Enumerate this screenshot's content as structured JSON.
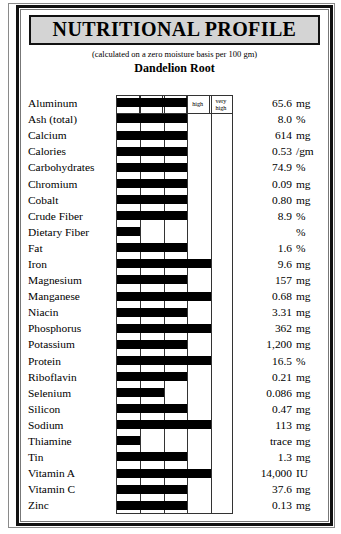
{
  "title": "NUTRITIONAL PROFILE",
  "subtitle": "(calculated on a zero moisture basis per 100 gm)",
  "plant": "Dandelion Root",
  "scale_headers": [
    "very low",
    "low",
    "ave",
    "high",
    "very high"
  ],
  "chart_data": {
    "type": "bar",
    "title": "NUTRITIONAL PROFILE",
    "subtitle": "(calculated on a zero moisture basis per 100 gm)",
    "xlabel": "",
    "ylabel": "",
    "orientation": "horizontal",
    "grid": true,
    "legend": "none",
    "scale_levels": [
      "very low",
      "low",
      "ave",
      "high",
      "very high"
    ],
    "xlim": [
      0,
      5
    ],
    "note": "bar_level is the bar's right-edge position on the 5-step scale (1 = end of 'very low', 3 = end of 'ave', 5 = end of 'very high')",
    "categories": [
      "Aluminum",
      "Ash (total)",
      "Calcium",
      "Calories",
      "Carbohydrates",
      "Chromium",
      "Cobalt",
      "Crude Fiber",
      "Dietary Fiber",
      "Fat",
      "Iron",
      "Magnesium",
      "Manganese",
      "Niacin",
      "Phosphorus",
      "Potassium",
      "Protein",
      "Riboflavin",
      "Selenium",
      "Silicon",
      "Sodium",
      "Thiamine",
      "Tin",
      "Vitamin A",
      "Vitamin C",
      "Zinc"
    ],
    "values": [
      65.6,
      8.0,
      614,
      0.53,
      74.9,
      0.09,
      0.8,
      8.9,
      null,
      1.6,
      9.6,
      157,
      0.68,
      3.31,
      362,
      1200,
      16.5,
      0.21,
      0.086,
      0.47,
      113,
      null,
      1.3,
      14000,
      37.6,
      0.13
    ],
    "bar_levels": [
      3,
      3,
      3,
      3,
      3,
      3,
      3,
      3,
      1,
      3,
      4,
      3,
      4,
      3,
      4,
      3,
      4,
      3,
      2,
      3,
      4,
      1,
      3,
      4,
      3,
      3
    ]
  },
  "rows": [
    {
      "name": "Aluminum",
      "value": "65.6",
      "unit": "mg",
      "level": 3
    },
    {
      "name": "Ash (total)",
      "value": "8.0",
      "unit": "%",
      "level": 3
    },
    {
      "name": "Calcium",
      "value": "614",
      "unit": "mg",
      "level": 3
    },
    {
      "name": "Calories",
      "value": "0.53",
      "unit": "/gm",
      "level": 3
    },
    {
      "name": "Carbohydrates",
      "value": "74.9",
      "unit": "%",
      "level": 3
    },
    {
      "name": "Chromium",
      "value": "0.09",
      "unit": "mg",
      "level": 3
    },
    {
      "name": "Cobalt",
      "value": "0.80",
      "unit": "mg",
      "level": 3
    },
    {
      "name": "Crude Fiber",
      "value": "8.9",
      "unit": "%",
      "level": 3
    },
    {
      "name": "Dietary Fiber",
      "value": "",
      "unit": "%",
      "level": 1
    },
    {
      "name": "Fat",
      "value": "1.6",
      "unit": "%",
      "level": 3
    },
    {
      "name": "Iron",
      "value": "9.6",
      "unit": "mg",
      "level": 4
    },
    {
      "name": "Magnesium",
      "value": "157",
      "unit": "mg",
      "level": 3
    },
    {
      "name": "Manganese",
      "value": "0.68",
      "unit": "mg",
      "level": 4
    },
    {
      "name": "Niacin",
      "value": "3.31",
      "unit": "mg",
      "level": 3
    },
    {
      "name": "Phosphorus",
      "value": "362",
      "unit": "mg",
      "level": 4
    },
    {
      "name": "Potassium",
      "value": "1,200",
      "unit": "mg",
      "level": 3
    },
    {
      "name": "Protein",
      "value": "16.5",
      "unit": "%",
      "level": 4
    },
    {
      "name": "Riboflavin",
      "value": "0.21",
      "unit": "mg",
      "level": 3
    },
    {
      "name": "Selenium",
      "value": "0.086",
      "unit": "mg",
      "level": 2
    },
    {
      "name": "Silicon",
      "value": "0.47",
      "unit": "mg",
      "level": 3
    },
    {
      "name": "Sodium",
      "value": "113",
      "unit": "mg",
      "level": 4
    },
    {
      "name": "Thiamine",
      "value": "trace",
      "unit": "mg",
      "level": 1
    },
    {
      "name": "Tin",
      "value": "1.3",
      "unit": "mg",
      "level": 3
    },
    {
      "name": "Vitamin A",
      "value": "14,000",
      "unit": "IU",
      "level": 4
    },
    {
      "name": "Vitamin C",
      "value": "37.6",
      "unit": "mg",
      "level": 3
    },
    {
      "name": "Zinc",
      "value": "0.13",
      "unit": "mg",
      "level": 3
    }
  ],
  "colors": {
    "bar": "#000000",
    "title_fill": "#d4d4d4",
    "border": "#111111",
    "grid_line": "#333333"
  }
}
